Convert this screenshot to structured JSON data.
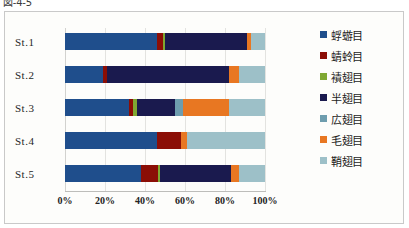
{
  "caption": {
    "text": "図-4-5"
  },
  "chart_data": {
    "type": "bar",
    "subtype": "stacked-horizontal-100pct",
    "title": "",
    "xlabel": "",
    "ylabel": "",
    "xlim": [
      0,
      100
    ],
    "xtick_labels": [
      "0%",
      "20%",
      "40%",
      "60%",
      "80%",
      "100%"
    ],
    "xticks": [
      0,
      20,
      40,
      60,
      80,
      100
    ],
    "grid": true,
    "legend_position": "right",
    "categories": [
      "St.1",
      "St.2",
      "St.3",
      "St.4",
      "St.5"
    ],
    "series": [
      {
        "name": "蜉蝣目",
        "color": "#1F4E8C",
        "values": [
          46.0,
          19.0,
          32.0,
          46.0,
          38.0
        ]
      },
      {
        "name": "蜻蛉目",
        "color": "#8B0E06",
        "values": [
          3.0,
          2.0,
          2.0,
          12.0,
          8.5
        ]
      },
      {
        "name": "襀翅目",
        "color": "#7FA832",
        "values": [
          1.0,
          0.0,
          2.0,
          0.0,
          1.0
        ]
      },
      {
        "name": "半翅目",
        "color": "#1A1A4E",
        "values": [
          41.0,
          61.0,
          19.0,
          0.0,
          35.5
        ]
      },
      {
        "name": "広翅目",
        "color": "#6E9DAE",
        "values": [
          0.0,
          0.0,
          4.0,
          0.0,
          0.0
        ]
      },
      {
        "name": "毛翅目",
        "color": "#E87722",
        "values": [
          2.0,
          5.0,
          23.0,
          3.0,
          4.0
        ]
      },
      {
        "name": "鞘翅目",
        "color": "#9DC0C8",
        "values": [
          7.0,
          13.0,
          18.0,
          39.0,
          13.0
        ]
      }
    ],
    "tan_trailing_color": "#C08058"
  }
}
